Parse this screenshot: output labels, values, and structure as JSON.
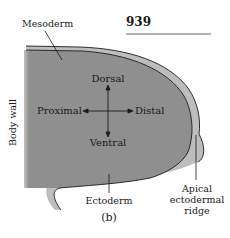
{
  "page_number": "939",
  "panel_label": "(b)",
  "labels": {
    "mesoderm": "Mesoderm",
    "body_wall": "Body wall",
    "ectoderm": "Ectoderm",
    "aer_line1": "Apical",
    "aer_line2": "ectodermal",
    "aer_line3": "ridge"
  },
  "axes": {
    "dorsal": "Dorsal",
    "ventral": "Ventral",
    "proximal": "Proximal",
    "distal": "Distal"
  },
  "colors": {
    "mesoderm_fill": "#8f8f8f",
    "ectoderm_fill": "#bdbdbd",
    "outline": "#1a1a1a",
    "rule": "#9a9a9a"
  }
}
